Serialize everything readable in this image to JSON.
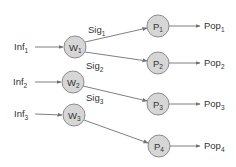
{
  "diagram": {
    "type": "network",
    "colors": {
      "node_fill": "#d6d6d6",
      "node_stroke": "#8c8c8c",
      "edge": "#707070",
      "text": "#333333"
    },
    "inputs": [
      {
        "id": "inf1",
        "base": "Inf",
        "sub": "1",
        "target": "w1"
      },
      {
        "id": "inf2",
        "base": "Inf",
        "sub": "2",
        "target": "w2"
      },
      {
        "id": "inf3",
        "base": "Inf",
        "sub": "3",
        "target": "w3"
      }
    ],
    "w_nodes": [
      {
        "id": "w1",
        "base": "W",
        "sub": "1",
        "signal": {
          "base": "Sig",
          "sub": "1"
        }
      },
      {
        "id": "w2",
        "base": "W",
        "sub": "2",
        "signal": {
          "base": "Sig",
          "sub": "2"
        }
      },
      {
        "id": "w3",
        "base": "W",
        "sub": "3",
        "signal": {
          "base": "Sig",
          "sub": "3"
        }
      }
    ],
    "p_nodes": [
      {
        "id": "p1",
        "base": "P",
        "sub": "1",
        "output": {
          "base": "Pop",
          "sub": "1"
        }
      },
      {
        "id": "p2",
        "base": "P",
        "sub": "2",
        "output": {
          "base": "Pop",
          "sub": "2"
        }
      },
      {
        "id": "p3",
        "base": "P",
        "sub": "3",
        "output": {
          "base": "Pop",
          "sub": "3"
        }
      },
      {
        "id": "p4",
        "base": "P",
        "sub": "4",
        "output": {
          "base": "Pop",
          "sub": "4"
        }
      }
    ],
    "edges": [
      {
        "from": "w1",
        "to": "p1"
      },
      {
        "from": "w1",
        "to": "p2"
      },
      {
        "from": "w2",
        "to": "p3"
      },
      {
        "from": "w3",
        "to": "p4"
      }
    ]
  }
}
